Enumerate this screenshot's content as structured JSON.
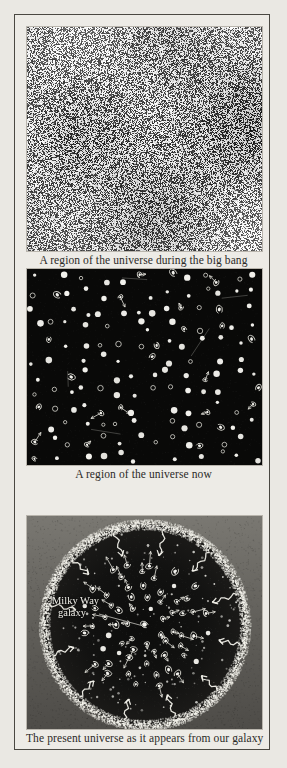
{
  "figure": {
    "panels": [
      {
        "id": "a",
        "letter": "a",
        "caption": "A region of the universe during the big bang",
        "kind": "noise-texture"
      },
      {
        "id": "b",
        "letter": "b",
        "caption": "A region of the universe now",
        "kind": "starfield-galaxies"
      },
      {
        "id": "c",
        "letter": "c",
        "caption": "The present universe as it appears from our galaxy",
        "kind": "circular-universe",
        "annotations": {
          "milky_way_line1": "Milky Way",
          "milky_way_line2": "galaxy"
        }
      }
    ],
    "colors": {
      "page_background": "#eae8e3",
      "frame_border": "#4a4842",
      "caption_text": "#2b2a27",
      "panel_b_background": "#090908",
      "panel_c_background": "#6e6c67",
      "star_white": "#f5f4ef",
      "label_white": "#f0efe9"
    }
  }
}
